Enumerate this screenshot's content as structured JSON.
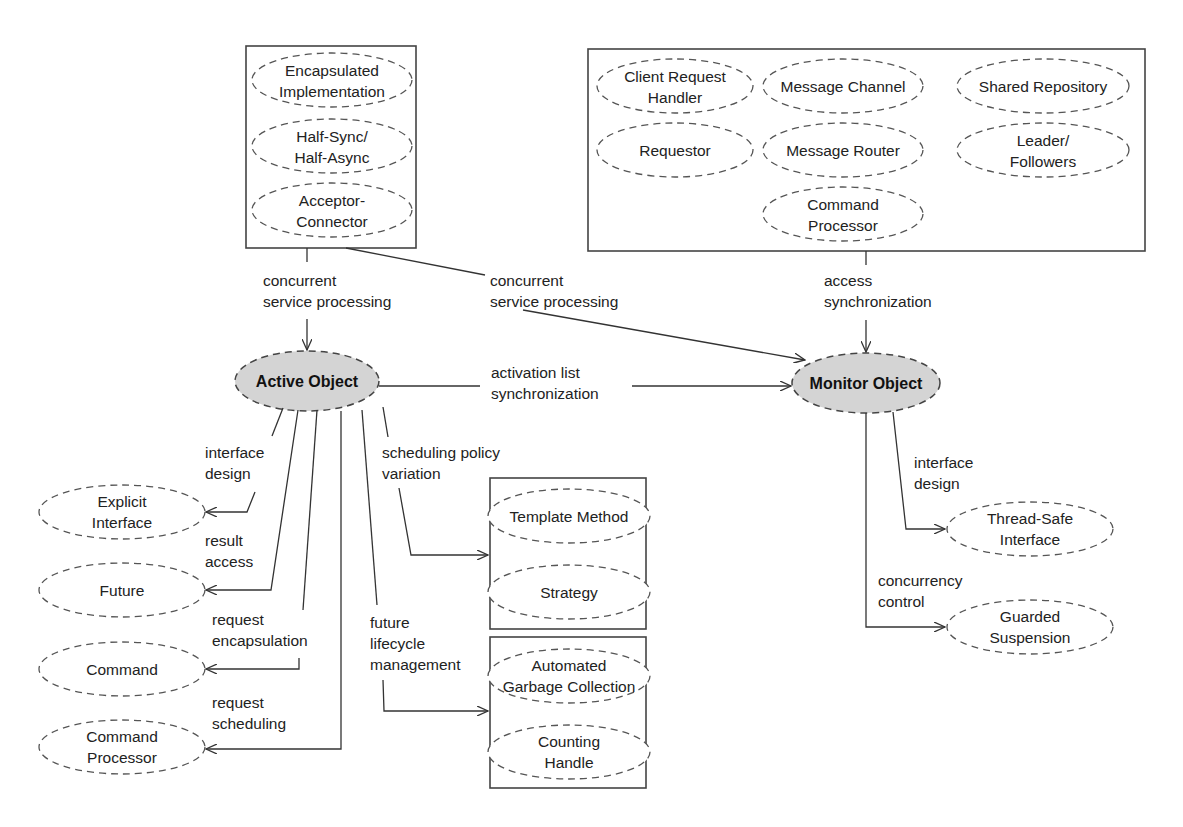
{
  "diagram": {
    "main_nodes": {
      "active_object": "Active Object",
      "monitor_object": "Monitor Object"
    },
    "groups": {
      "top_left": [
        [
          "Encapsulated",
          "Implementation"
        ],
        [
          "Half-Sync/",
          "Half-Async"
        ],
        [
          "Acceptor-",
          "Connector"
        ]
      ],
      "top_right": [
        [
          "Client Request",
          "Handler"
        ],
        [
          "Message Channel"
        ],
        [
          "Shared Repository"
        ],
        [
          "Requestor"
        ],
        [
          "Message Router"
        ],
        [
          "Leader/",
          "Followers"
        ],
        [
          "Command",
          "Processor"
        ]
      ],
      "scheduling": [
        [
          "Template Method"
        ],
        [
          "Strategy"
        ]
      ],
      "lifecycle": [
        [
          "Automated",
          "Garbage Collection"
        ],
        [
          "Counting",
          "Handle"
        ]
      ]
    },
    "left_nodes": [
      [
        "Explicit",
        "Interface"
      ],
      [
        "Future"
      ],
      [
        "Command"
      ],
      [
        "Command",
        "Processor"
      ]
    ],
    "right_nodes": [
      [
        "Thread-Safe",
        "Interface"
      ],
      [
        "Guarded",
        "Suspension"
      ]
    ],
    "edge_labels": {
      "tl_to_active": [
        "concurrent",
        "service processing"
      ],
      "tl_to_monitor": [
        "concurrent",
        "service processing"
      ],
      "tr_to_monitor": [
        "access",
        "synchronization"
      ],
      "active_to_monitor": [
        "activation list",
        "synchronization"
      ],
      "interface_design_left": [
        "interface",
        "design"
      ],
      "result_access": [
        "result",
        "access"
      ],
      "request_encapsulation": [
        "request",
        "encapsulation"
      ],
      "request_scheduling": [
        "request",
        "scheduling"
      ],
      "scheduling_policy": [
        "scheduling policy",
        "variation"
      ],
      "future_lifecycle": [
        "future",
        "lifecycle",
        "management"
      ],
      "interface_design_right": [
        "interface",
        "design"
      ],
      "concurrency_control": [
        "concurrency",
        "control"
      ]
    }
  }
}
